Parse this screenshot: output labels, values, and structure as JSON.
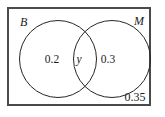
{
  "figure": {
    "type": "venn-diagram",
    "universe_border_color": "#4a4a4a",
    "circle_border_color": "#262626",
    "background_color": "#ffffff",
    "text_color": "#1c1c1c"
  },
  "sets": {
    "left_label": "B",
    "right_label": "M"
  },
  "regions": {
    "left_only": "0.2",
    "intersection": "y",
    "right_only": "0.3",
    "outside": "0.35"
  },
  "chart_data": {
    "type": "table",
    "title": "",
    "categories": [
      "B only",
      "B and M",
      "M only",
      "Neither"
    ],
    "values": [
      0.2,
      null,
      0.3,
      0.35
    ],
    "labels": [
      "0.2",
      "y",
      "0.3",
      "0.35"
    ],
    "xlabel": "",
    "ylabel": ""
  }
}
